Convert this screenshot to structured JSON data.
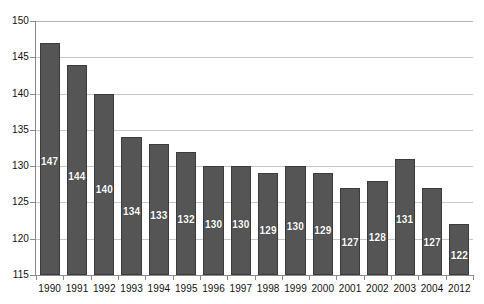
{
  "chart_data": {
    "type": "bar",
    "title": "",
    "subtitle": "",
    "xlabel": "",
    "ylabel": "",
    "categories": [
      "1990",
      "1991",
      "1992",
      "1993",
      "1994",
      "1995",
      "1996",
      "1997",
      "1998",
      "1999",
      "2000",
      "2001",
      "2002",
      "2003",
      "2004",
      "2012"
    ],
    "values": [
      147,
      144,
      140,
      134,
      133,
      132,
      130,
      130,
      129,
      130,
      129,
      127,
      128,
      131,
      127,
      122
    ],
    "data_labels": [
      "147",
      "144",
      "140",
      "134",
      "133",
      "132",
      "130",
      "130",
      "129",
      "130",
      "129",
      "127",
      "128",
      "131",
      "127",
      "122"
    ],
    "ylim": [
      115,
      150
    ],
    "ytick_values": [
      115,
      120,
      125,
      130,
      135,
      140,
      145,
      150
    ],
    "ytick_labels": [
      "115",
      "120",
      "125",
      "130",
      "135",
      "140",
      "145",
      "150"
    ],
    "grid": true,
    "grid_axis": "y",
    "legend": false,
    "legend_position": "none",
    "series": [
      {
        "name": "",
        "values": [
          147,
          144,
          140,
          134,
          133,
          132,
          130,
          130,
          129,
          130,
          129,
          127,
          128,
          131,
          127,
          122
        ]
      }
    ],
    "colors": {
      "bar_fill": "#555555",
      "bar_border": "#3b3b3b",
      "gridline": "#c6c6c6",
      "axis": "#8a8a8a",
      "data_label_text": "#ffffff",
      "tick_text": "#111111",
      "background": "#ffffff"
    }
  }
}
